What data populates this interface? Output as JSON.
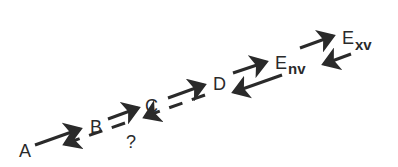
{
  "diagram": {
    "type": "reaction-scheme",
    "nodes": [
      {
        "id": "A",
        "label": "A"
      },
      {
        "id": "B",
        "label": "B"
      },
      {
        "id": "C",
        "label": "C"
      },
      {
        "id": "D",
        "label": "D"
      },
      {
        "id": "Env",
        "label": "E",
        "subscript": "nv"
      },
      {
        "id": "Exv",
        "label": "E",
        "subscript": "xv"
      }
    ],
    "unknown_label": "?",
    "edges": [
      {
        "from": "A",
        "to": "B",
        "style": "solid"
      },
      {
        "from": "B",
        "to": "C",
        "style": "solid"
      },
      {
        "from": "C",
        "to": "D",
        "style": "solid"
      },
      {
        "from": "D",
        "to": "Env",
        "style": "solid"
      },
      {
        "from": "Env",
        "to": "Exv",
        "style": "solid"
      },
      {
        "from": "Exv",
        "to": "Env",
        "style": "solid"
      },
      {
        "from": "Env",
        "to": "D",
        "style": "solid"
      },
      {
        "from": "D",
        "to": "C",
        "style": "dashed"
      },
      {
        "from": "C",
        "to": "A",
        "style": "dashed",
        "label": "?"
      }
    ]
  }
}
